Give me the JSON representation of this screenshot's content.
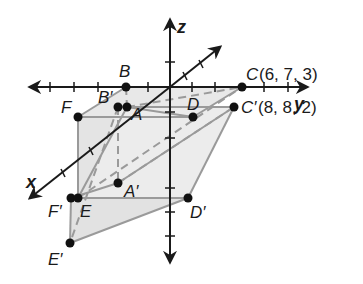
{
  "axes": {
    "x_label": "x",
    "y_label": "y",
    "z_label": "z"
  },
  "points": {
    "A": "A",
    "B": "B",
    "C": "C",
    "D": "D",
    "E": "E",
    "F": "F",
    "A_prime": "A′",
    "B_prime": "B′",
    "C_prime": "C′",
    "D_prime": "D′",
    "E_prime": "E′",
    "F_prime": "F′"
  },
  "coordinates": {
    "C": "(6, 7, 3)",
    "C_prime": "(8, 8, 2)"
  },
  "colors": {
    "axis": "#1a1a1a",
    "edge": "#9a9a9a",
    "fill": "#e6e6e6",
    "point": "#111111"
  }
}
